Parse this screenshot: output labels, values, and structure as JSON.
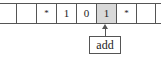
{
  "tape": {
    "cells": [
      {
        "symbol": "",
        "highlighted": false
      },
      {
        "symbol": "*",
        "highlighted": false
      },
      {
        "symbol": "1",
        "highlighted": false
      },
      {
        "symbol": "0",
        "highlighted": false
      },
      {
        "symbol": "1",
        "highlighted": true
      },
      {
        "symbol": "*",
        "highlighted": false
      },
      {
        "symbol": "",
        "highlighted": false
      }
    ]
  },
  "head": {
    "state_label": "add"
  },
  "colors": {
    "highlight": "#d9d9d9",
    "line": "#555555"
  }
}
